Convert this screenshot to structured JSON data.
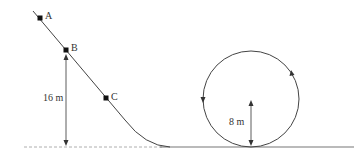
{
  "diagram": {
    "points": [
      {
        "label": "A"
      },
      {
        "label": "B"
      },
      {
        "label": "C"
      }
    ],
    "dimensions": {
      "height_label": "16 m",
      "radius_label": "8 m"
    },
    "colors": {
      "stroke": "#444444",
      "point": "#111111",
      "ground_dashed": "#999999",
      "ground_solid": "#777777"
    }
  }
}
